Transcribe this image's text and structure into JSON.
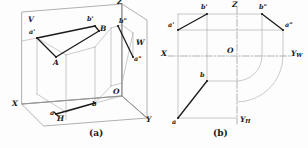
{
  "figure": {
    "colors": {
      "ink": "#1a1a1a",
      "thin_line": "#8f8f8f",
      "background": "#fdfdfd"
    },
    "captions": [
      {
        "id": "caption-a",
        "text": "(a)"
      },
      {
        "id": "caption-b",
        "text": "(b)"
      }
    ]
  },
  "diagram_a": {
    "name": "pictorial-view",
    "caption": "(a)",
    "axis_labels": [
      {
        "id": "axis-z",
        "text": "Z"
      },
      {
        "id": "axis-x",
        "text": "X"
      },
      {
        "id": "axis-y",
        "text": "Y"
      },
      {
        "id": "origin",
        "text": "O"
      }
    ],
    "plane_labels": [
      {
        "id": "plane-v",
        "text": "V"
      },
      {
        "id": "plane-h",
        "text": "H"
      },
      {
        "id": "plane-w",
        "text": "W"
      }
    ],
    "point_labels": [
      {
        "id": "point-A",
        "text": "A"
      },
      {
        "id": "point-B",
        "text": "B"
      },
      {
        "id": "proj-a-front",
        "text": "a'"
      },
      {
        "id": "proj-b-front",
        "text": "b'"
      },
      {
        "id": "proj-a-side",
        "text": "a\""
      },
      {
        "id": "proj-b-side",
        "text": "b\""
      },
      {
        "id": "proj-a-top",
        "text": "a"
      },
      {
        "id": "proj-b-top",
        "text": "b"
      }
    ]
  },
  "diagram_b": {
    "name": "unfolded-projection-view",
    "caption": "(b)",
    "axis_labels": [
      {
        "id": "axis-z",
        "text": "Z"
      },
      {
        "id": "axis-x",
        "text": "X"
      },
      {
        "id": "origin",
        "text": "O"
      },
      {
        "id": "axis-yw",
        "text": "Y",
        "subscript": "W"
      },
      {
        "id": "axis-yh",
        "text": "Y",
        "subscript": "H"
      }
    ],
    "point_labels": [
      {
        "id": "proj-a-front",
        "text": "a'"
      },
      {
        "id": "proj-b-front",
        "text": "b'"
      },
      {
        "id": "proj-a-side",
        "text": "a\""
      },
      {
        "id": "proj-b-side",
        "text": "b\""
      },
      {
        "id": "proj-a-top",
        "text": "a"
      },
      {
        "id": "proj-b-top",
        "text": "b"
      }
    ]
  }
}
